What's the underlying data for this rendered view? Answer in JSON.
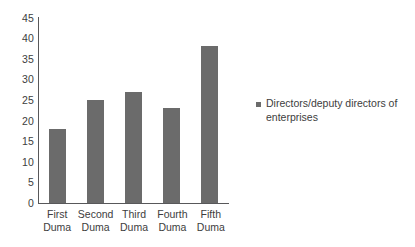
{
  "chart_data": {
    "type": "bar",
    "title": "",
    "subtitle": "",
    "xlabel": "",
    "ylabel": "",
    "categories": [
      "First Duma",
      "Second Duma",
      "Third Duma",
      "Fourth Duma",
      "Fifth Duma"
    ],
    "category_lines": [
      [
        "First",
        "Duma"
      ],
      [
        "Second",
        "Duma"
      ],
      [
        "Third",
        "Duma"
      ],
      [
        "Fourth",
        "Duma"
      ],
      [
        "Fifth",
        "Duma"
      ]
    ],
    "values": [
      18,
      25,
      27,
      23,
      38
    ],
    "series": [
      {
        "name": "Directors/deputy directors of enterprises",
        "values": [
          18,
          25,
          27,
          23,
          38
        ],
        "color": "#6b6b6b"
      }
    ],
    "ylim": [
      0,
      45
    ],
    "ytick_step": 5,
    "yticks": [
      45,
      40,
      35,
      30,
      25,
      20,
      15,
      10,
      5,
      0
    ],
    "ytick_labels": [
      "45",
      "40",
      "35",
      "30",
      "25",
      "20",
      "15",
      "10",
      "5",
      "0"
    ],
    "grid": false,
    "legend_position": "right"
  },
  "legend": {
    "marker_name": "legend-color-swatch",
    "label": "Directors/deputy directors of enterprises",
    "color": "#6b6b6b"
  },
  "colors": {
    "bar": "#6b6b6b",
    "axis": "#58585a",
    "text": "#3d3d3d",
    "background": "#ffffff"
  }
}
